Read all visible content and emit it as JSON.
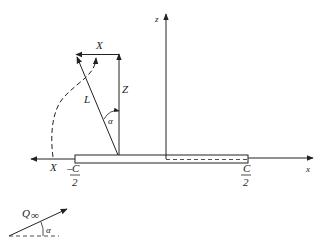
{
  "diagram": {
    "axes": {
      "z_label": "z",
      "x_label": "x"
    },
    "vectors": {
      "lift_label": "L",
      "normal_force_label": "Z",
      "axial_force_top_label": "X",
      "axial_force_bottom_label": "X",
      "angle_label": "α"
    },
    "chord_labels": {
      "left_sign": "−",
      "left_numerator": "C",
      "left_denominator": "2",
      "right_numerator": "C",
      "right_denominator": "2"
    },
    "freestream": {
      "label": "Q",
      "subscript": "∞",
      "angle_label": "α"
    },
    "colors": {
      "stroke": "#222222",
      "background": "#ffffff"
    }
  }
}
